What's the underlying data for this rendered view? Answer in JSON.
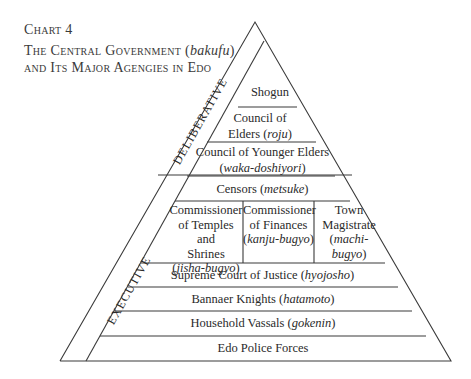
{
  "caption": {
    "chart_number": "Chart 4",
    "title_line1_prefix": "The Central Government (",
    "title_line1_italic": "bakufu",
    "title_line1_suffix": ")",
    "title_line2": "and Its Major Agengies in Edo"
  },
  "strips": {
    "deliberative": "DELIBERATIVE",
    "executive": "EXECUTIVE"
  },
  "levels": [
    {
      "name": "Shogun",
      "term": ""
    },
    {
      "name": "Council of Elders",
      "line1": "Council of",
      "line2": "Elders (",
      "term": "roju",
      "close": ")"
    },
    {
      "name": "Council of Younger Elders",
      "line1": "Council of Younger Elders",
      "term": "waka-doshiyori"
    },
    {
      "name": "Censors",
      "text": "Censors (",
      "term": "metsuke",
      "close": ")"
    },
    {
      "group": [
        {
          "l1": "Commissioner",
          "l2": "of Temples and",
          "l3": "Shrines",
          "term": "jisha-bugyo"
        },
        {
          "l1": "Commissioner",
          "l2": "of Finances",
          "term": "kanju-bugyo"
        },
        {
          "l1": "Town",
          "l2": "Magistrate",
          "term": "machi-bugyo"
        }
      ]
    },
    {
      "name": "Supreme Court of Justice",
      "text": "Supreme Court of Justice (",
      "term": "hyojosho",
      "close": ")"
    },
    {
      "name": "Bannaer Knights",
      "text": "Bannaer Knights (",
      "term": "hatamoto",
      "close": ")"
    },
    {
      "name": "Household Vassals",
      "text": "Household Vassals (",
      "term": "gokenin",
      "close": ")"
    },
    {
      "name": "Edo Police Forces",
      "text": "Edo Police Forces"
    }
  ],
  "colors": {
    "line": "#3a3a3a",
    "text": "#2a2a2a",
    "background": "#ffffff"
  }
}
